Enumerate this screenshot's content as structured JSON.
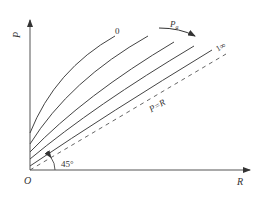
{
  "diagram": {
    "type": "P-R curve family",
    "axes": {
      "y_label": "P",
      "x_label": "R",
      "origin_label": "O"
    },
    "angle_label": "45°",
    "reference_line": {
      "label": "P=R",
      "style": "dashed"
    },
    "curves": [
      {
        "label": "0"
      },
      {
        "label": ""
      },
      {
        "label": ""
      },
      {
        "label": ""
      },
      {
        "label": "1∞"
      }
    ],
    "arrow": {
      "label": "P",
      "subscript": "a"
    },
    "colors": {
      "line": "#444444",
      "text": "#333333",
      "background": "#ffffff"
    }
  }
}
